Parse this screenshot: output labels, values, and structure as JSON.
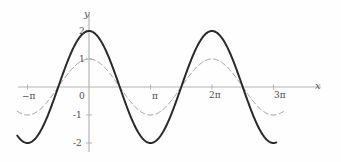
{
  "chart_data": {
    "type": "line",
    "title": "",
    "xlabel": "x",
    "ylabel": "y",
    "xlim": [
      -3.6651914291881,
      10.2101761241668
    ],
    "ylim": [
      -2.6,
      2.6
    ],
    "grid": false,
    "legend": "none",
    "x_tick_labels": [
      "−π",
      "0",
      "π",
      "2π",
      "3π"
    ],
    "x_tick_values": [
      -3.14159265,
      0,
      3.14159265,
      6.28318531,
      9.42477796
    ],
    "y_tick_labels": [
      "2",
      "1",
      "-1",
      "-2"
    ],
    "y_tick_values": [
      2,
      1,
      -1,
      -2
    ],
    "series": [
      {
        "name": "2cos(x)",
        "style": "solid",
        "color": "#2a2a2a",
        "width": 2.0,
        "amplitude": 2,
        "function": "y = 2*cos(x)",
        "x_start": -3.6651914291881,
        "x_end": 9.5702271366531,
        "key_points": [
          {
            "x": -3.14159265,
            "y": -2
          },
          {
            "x": -1.57079633,
            "y": 0
          },
          {
            "x": 0,
            "y": 2
          },
          {
            "x": 1.57079633,
            "y": 0
          },
          {
            "x": 3.14159265,
            "y": -2
          },
          {
            "x": 4.71238898,
            "y": 0
          },
          {
            "x": 6.28318531,
            "y": 2
          },
          {
            "x": 7.85398163,
            "y": 0
          },
          {
            "x": 9.42477796,
            "y": -2
          }
        ]
      },
      {
        "name": "cos(x)",
        "style": "dashed",
        "color": "#9a9a9a",
        "width": 1.0,
        "amplitude": 1,
        "function": "y = cos(x)",
        "x_start": -3.6651914291881,
        "x_end": 10.0530964914873,
        "key_points": [
          {
            "x": -3.14159265,
            "y": -1
          },
          {
            "x": -1.57079633,
            "y": 0
          },
          {
            "x": 0,
            "y": 1
          },
          {
            "x": 1.57079633,
            "y": 0
          },
          {
            "x": 3.14159265,
            "y": -1
          },
          {
            "x": 4.71238898,
            "y": 0
          },
          {
            "x": 6.28318531,
            "y": 1
          },
          {
            "x": 7.85398163,
            "y": 0
          },
          {
            "x": 9.42477796,
            "y": -1
          }
        ]
      }
    ]
  },
  "geometry": {
    "origin_x": 89,
    "origin_y": 87,
    "px_per_unit_x": 19.576,
    "px_per_unit_y": 28.0,
    "x_axis_left": 18,
    "x_axis_right": 321,
    "y_axis_top": 14,
    "y_axis_bottom": 152
  },
  "colors": {
    "background": "#fefefe",
    "axis": "#b4b4b4",
    "solid_curve": "#2a2a2a",
    "dashed_curve": "#9a9a9a",
    "tick_label": "#4a4a4a",
    "axis_name": "#5a5a5a"
  },
  "labels": {
    "x_axis_name": "x",
    "y_axis_name": "y",
    "x_neg_pi": "−π",
    "x_zero": "0",
    "x_pi": "π",
    "x_2pi": "2π",
    "x_3pi": "3π",
    "y_two": "2",
    "y_one": "1",
    "y_neg_one": "-1",
    "y_neg_two": "-2"
  }
}
